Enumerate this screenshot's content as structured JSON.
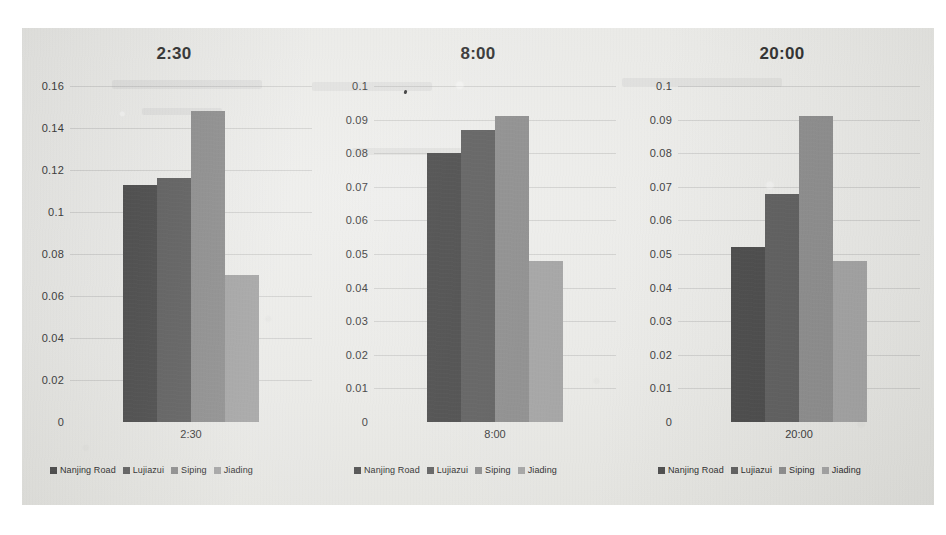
{
  "chart_data": [
    {
      "type": "bar",
      "title": "2:30",
      "categories": [
        "2:30"
      ],
      "series": [
        {
          "name": "Nanjing Road",
          "values": [
            0.113
          ],
          "color": "#4b4b4b"
        },
        {
          "name": "Lujiazui",
          "values": [
            0.116
          ],
          "color": "#5f5f5f"
        },
        {
          "name": "Siping",
          "values": [
            0.148
          ],
          "color": "#8d8d8d"
        },
        {
          "name": "Jiading",
          "values": [
            0.07
          ],
          "color": "#a3a3a3"
        }
      ],
      "xlabel": "",
      "ylabel": "",
      "ylim": [
        0,
        0.16
      ],
      "yticks": [
        "0",
        "0.02",
        "0.04",
        "0.06",
        "0.08",
        "0.1",
        "0.12",
        "0.14",
        "0.16"
      ],
      "ytick_values": [
        0,
        0.02,
        0.04,
        0.06,
        0.08,
        0.1,
        0.12,
        0.14,
        0.16
      ],
      "grid": true,
      "legend_position": "bottom"
    },
    {
      "type": "bar",
      "title": "8:00",
      "categories": [
        "8:00"
      ],
      "series": [
        {
          "name": "Nanjing Road",
          "values": [
            0.08
          ],
          "color": "#4b4b4b"
        },
        {
          "name": "Lujiazui",
          "values": [
            0.087
          ],
          "color": "#5f5f5f"
        },
        {
          "name": "Siping",
          "values": [
            0.091
          ],
          "color": "#8d8d8d"
        },
        {
          "name": "Jiading",
          "values": [
            0.048
          ],
          "color": "#a3a3a3"
        }
      ],
      "xlabel": "",
      "ylabel": "",
      "ylim": [
        0,
        0.1
      ],
      "yticks": [
        "0",
        "0.01",
        "0.02",
        "0.03",
        "0.04",
        "0.05",
        "0.06",
        "0.07",
        "0.08",
        "0.09",
        "0.1"
      ],
      "ytick_values": [
        0,
        0.01,
        0.02,
        0.03,
        0.04,
        0.05,
        0.06,
        0.07,
        0.08,
        0.09,
        0.1
      ],
      "grid": true,
      "legend_position": "bottom"
    },
    {
      "type": "bar",
      "title": "20:00",
      "categories": [
        "20:00"
      ],
      "series": [
        {
          "name": "Nanjing Road",
          "values": [
            0.052
          ],
          "color": "#4b4b4b"
        },
        {
          "name": "Lujiazui",
          "values": [
            0.068
          ],
          "color": "#5f5f5f"
        },
        {
          "name": "Siping",
          "values": [
            0.091
          ],
          "color": "#8d8d8d"
        },
        {
          "name": "Jiading",
          "values": [
            0.048
          ],
          "color": "#a3a3a3"
        }
      ],
      "xlabel": "",
      "ylabel": "",
      "ylim": [
        0,
        0.1
      ],
      "yticks": [
        "0",
        "0.01",
        "0.02",
        "0.03",
        "0.04",
        "0.05",
        "0.06",
        "0.07",
        "0.08",
        "0.09",
        "0.1"
      ],
      "ytick_values": [
        0,
        0.01,
        0.02,
        0.03,
        0.04,
        0.05,
        0.06,
        0.07,
        0.08,
        0.09,
        0.1
      ],
      "grid": true,
      "legend_position": "bottom"
    }
  ],
  "colors": {
    "series_1": "#4b4b4b",
    "series_2": "#5f5f5f",
    "series_3": "#8d8d8d",
    "series_4": "#a3a3a3",
    "page_background": "#e8e8e5",
    "text": "#2f2f2f",
    "gridline": "#969696"
  }
}
